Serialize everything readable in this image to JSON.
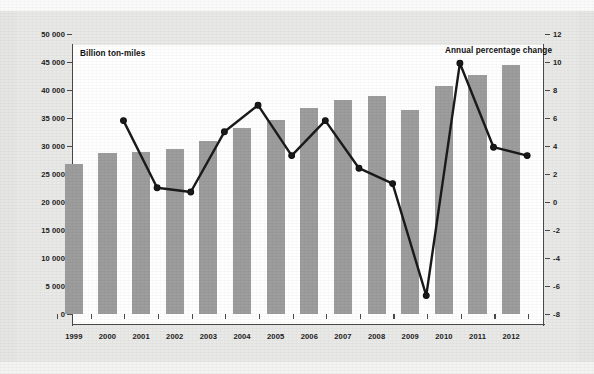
{
  "chart_data": {
    "type": "bar",
    "title": "",
    "subtitle": "",
    "xlabel": "",
    "categories": [
      "1999",
      "2000",
      "2001",
      "2002",
      "2003",
      "2004",
      "2005",
      "2006",
      "2007",
      "2008",
      "2009",
      "2010",
      "2011",
      "2012"
    ],
    "grid": false,
    "legend_position": "in-plot-annotations",
    "series": [
      {
        "name": "Billion ton-miles",
        "type": "bar",
        "axis": "left",
        "color": "#9d9d9d",
        "values": [
          26800,
          28700,
          29000,
          29400,
          30900,
          33300,
          34700,
          36800,
          38200,
          39000,
          36500,
          40700,
          42700,
          44500
        ]
      },
      {
        "name": "Annual percentage change",
        "type": "line",
        "axis": "right",
        "color": "#1a1a1a",
        "values": [
          null,
          6.6,
          1.8,
          1.5,
          5.8,
          7.7,
          4.1,
          6.6,
          3.2,
          2.1,
          -5.9,
          10.7,
          4.7,
          4.1
        ]
      }
    ],
    "left_axis": {
      "label": "Billion ton-miles",
      "ylim": [
        0,
        50000
      ],
      "tick_step": 5000,
      "ticks": [
        0,
        5000,
        10000,
        15000,
        20000,
        25000,
        30000,
        35000,
        40000,
        45000,
        50000
      ],
      "tick_labels": [
        "0",
        "5 000",
        "10 000",
        "15 000",
        "20 000",
        "25 000",
        "30 000",
        "35 000",
        "40 000",
        "45 000",
        "50 000"
      ]
    },
    "right_axis": {
      "label": "Annual percentage change",
      "ylim": [
        -8,
        12
      ],
      "tick_step": 2,
      "ticks": [
        -8,
        -6,
        -4,
        -2,
        0,
        2,
        4,
        6,
        8,
        10,
        12
      ],
      "tick_labels": [
        "-8",
        "-6",
        "-4",
        "-2",
        "0",
        "2",
        "4",
        "6",
        "8",
        "10",
        "12"
      ]
    }
  },
  "annotations": {
    "left_series_label": "Billion ton-miles",
    "right_series_label": "Annual percentage change"
  },
  "colors": {
    "bar_fill": "#9d9d9d",
    "line_stroke": "#1a1a1a",
    "marker_fill": "#555555",
    "axis": "#4a4a4a",
    "plot_background": "#ffffff",
    "figure_background": "#e9e9e7",
    "page_background": "#e6e6e4"
  }
}
